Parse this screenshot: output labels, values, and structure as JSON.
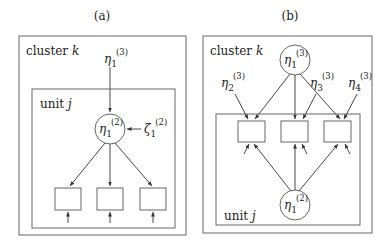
{
  "panels": [
    {
      "id": "a",
      "caption": "(a)",
      "cluster_label": "cluster",
      "cluster_var": "k",
      "unit_label": "unit",
      "unit_var": "j",
      "top_latent": {
        "symbol": "η",
        "sub": "1",
        "sup": "(3)"
      },
      "circle_latent": {
        "symbol": "η",
        "sub": "1",
        "sup": "(2)"
      },
      "disturbance": {
        "symbol": "ζ",
        "sub": "1",
        "sup": "(2)"
      },
      "indicator_count": 3
    },
    {
      "id": "b",
      "caption": "(b)",
      "cluster_label": "cluster",
      "cluster_var": "k",
      "unit_label": "unit",
      "unit_var": "j",
      "top_circle_latent": {
        "symbol": "η",
        "sub": "1",
        "sup": "(3)"
      },
      "specific_latents": [
        {
          "symbol": "η",
          "sub": "2",
          "sup": "(3)"
        },
        {
          "symbol": "η",
          "sub": "3",
          "sup": "(3)"
        },
        {
          "symbol": "η",
          "sub": "4",
          "sup": "(3)"
        }
      ],
      "bottom_circle_latent": {
        "symbol": "η",
        "sub": "1",
        "sup": "(2)"
      },
      "indicator_count": 3
    }
  ],
  "colors": {
    "line": "#444444",
    "box": "#666666",
    "text": "#222222"
  }
}
